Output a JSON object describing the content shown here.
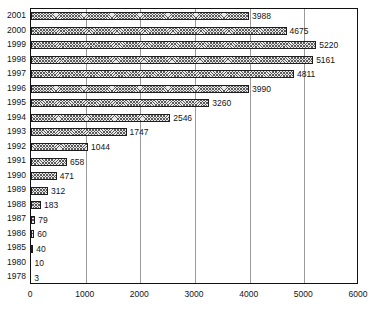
{
  "chart_data": {
    "type": "bar",
    "orientation": "horizontal",
    "title": "",
    "subtitle": "",
    "xlabel": "",
    "ylabel": "",
    "xlim": [
      0,
      6000
    ],
    "xticks": [
      0,
      1000,
      2000,
      3000,
      4000,
      5000,
      6000
    ],
    "xtick_labels": [
      "0",
      "1000",
      "2000",
      "3000",
      "4000",
      "5000",
      "6000"
    ],
    "grid": "vertical",
    "legend": null,
    "legend_position": "none",
    "bar_fill": "crosshatch-pattern",
    "bar_border_color": "#1d1d1d",
    "gridline_color": "#9a9a9a",
    "axis_color": "#111111",
    "background": "#ffffff",
    "data_labels": true,
    "categories": [
      "2001",
      "2000",
      "1999",
      "1998",
      "1997",
      "1996",
      "1995",
      "1994",
      "1993",
      "1992",
      "1991",
      "1990",
      "1989",
      "1988",
      "1987",
      "1986",
      "1985",
      "1980",
      "1978"
    ],
    "values": [
      3988,
      4675,
      5220,
      5161,
      4811,
      3990,
      3260,
      2546,
      1747,
      1044,
      658,
      471,
      312,
      183,
      79,
      60,
      40,
      10,
      3
    ],
    "value_labels": [
      "3988",
      "4675",
      "5220",
      "5161",
      "4811",
      "3990",
      "3260",
      "2546",
      "1747",
      "1044",
      "658",
      "471",
      "312",
      "183",
      "79",
      "60",
      "40",
      "10",
      "3"
    ]
  }
}
